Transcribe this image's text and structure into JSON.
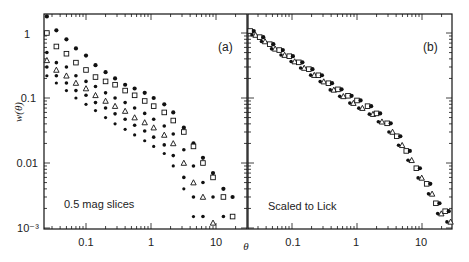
{
  "figure": {
    "panel_a_label": "(a)",
    "panel_b_label": "(b)",
    "panel_a_annotation": "0.5 mag slices",
    "panel_b_annotation": "Scaled to Lick",
    "ylabel": "w(θ)",
    "xlabel": "θ",
    "y_ticks": [
      "1",
      "0.1",
      "0.01",
      "10⁻³"
    ],
    "x_ticks": [
      "0.1",
      "1",
      "10"
    ]
  },
  "chart_data": [
    {
      "type": "scatter",
      "title": "(a)",
      "annotation": "0.5 mag slices",
      "xlabel": "θ",
      "ylabel": "w(θ)",
      "xscale": "log",
      "yscale": "log",
      "xlim": [
        0.022,
        30
      ],
      "ylim": [
        0.001,
        2
      ],
      "x_ticks": [
        0.1,
        1,
        10
      ],
      "y_ticks": [
        1,
        0.1,
        0.01,
        0.001
      ],
      "grid": false,
      "series": [
        {
          "name": "slice 1",
          "marker": "star",
          "x": [
            0.025,
            0.035,
            0.05,
            0.07,
            0.1,
            0.14,
            0.2,
            0.28,
            0.4,
            0.56,
            0.8,
            1.1,
            1.6,
            2.2,
            3.2,
            4.5,
            6.3,
            9,
            13,
            18
          ],
          "y": [
            1.8,
            1.1,
            0.8,
            0.58,
            0.45,
            0.32,
            0.25,
            0.2,
            0.16,
            0.14,
            0.12,
            0.1,
            0.08,
            0.06,
            0.035,
            0.02,
            0.012,
            0.007,
            0.004,
            0.003
          ]
        },
        {
          "name": "slice 2",
          "marker": "open-square",
          "x": [
            0.025,
            0.035,
            0.05,
            0.07,
            0.1,
            0.14,
            0.2,
            0.28,
            0.4,
            0.56,
            0.8,
            1.1,
            1.6,
            2.2,
            3.2,
            4.5,
            6.3,
            9,
            13,
            18
          ],
          "y": [
            1.0,
            0.62,
            0.48,
            0.35,
            0.27,
            0.21,
            0.18,
            0.16,
            0.13,
            0.11,
            0.09,
            0.075,
            0.06,
            0.045,
            0.03,
            0.018,
            0.01,
            0.006,
            0.003,
            0.0015
          ]
        },
        {
          "name": "slice 3",
          "marker": "filled-circle",
          "x": [
            0.025,
            0.035,
            0.05,
            0.07,
            0.1,
            0.14,
            0.2,
            0.28,
            0.4,
            0.56,
            0.8,
            1.1,
            1.6,
            2.2,
            3.2,
            4.5,
            6.3,
            9,
            13
          ],
          "y": [
            0.5,
            0.35,
            0.3,
            0.22,
            0.18,
            0.15,
            0.12,
            0.1,
            0.085,
            0.07,
            0.058,
            0.047,
            0.037,
            0.028,
            0.016,
            0.009,
            0.005,
            0.003,
            0.0015
          ]
        },
        {
          "name": "slice 4",
          "marker": "open-triangle",
          "x": [
            0.025,
            0.035,
            0.05,
            0.07,
            0.1,
            0.14,
            0.2,
            0.28,
            0.4,
            0.56,
            0.8,
            1.1,
            1.6,
            2.2,
            3.2,
            4.5,
            6.3,
            9
          ],
          "y": [
            0.38,
            0.27,
            0.22,
            0.17,
            0.14,
            0.11,
            0.09,
            0.075,
            0.063,
            0.05,
            0.042,
            0.035,
            0.027,
            0.02,
            0.01,
            0.005,
            0.003,
            0.0012
          ]
        },
        {
          "name": "slice 5",
          "marker": "filled-circle",
          "x": [
            0.025,
            0.035,
            0.05,
            0.07,
            0.1,
            0.14,
            0.2,
            0.28,
            0.4,
            0.56,
            0.8,
            1.1,
            1.6,
            2.2,
            3.2,
            4.5,
            6.3
          ],
          "y": [
            0.3,
            0.22,
            0.17,
            0.13,
            0.11,
            0.085,
            0.07,
            0.057,
            0.047,
            0.038,
            0.031,
            0.025,
            0.019,
            0.013,
            0.006,
            0.003,
            0.0015
          ]
        },
        {
          "name": "slice 6",
          "marker": "asterisk",
          "x": [
            0.025,
            0.035,
            0.05,
            0.07,
            0.1,
            0.14,
            0.2,
            0.28,
            0.4,
            0.56,
            0.8,
            1.1,
            1.6,
            2.2,
            3.2,
            4.5
          ],
          "y": [
            0.22,
            0.17,
            0.13,
            0.1,
            0.08,
            0.064,
            0.05,
            0.04,
            0.033,
            0.027,
            0.022,
            0.018,
            0.014,
            0.009,
            0.004,
            0.0015
          ]
        }
      ]
    },
    {
      "type": "scatter",
      "title": "(b)",
      "annotation": "Scaled to Lick",
      "xlabel": "θ",
      "ylabel": "w(θ)",
      "xscale": "log",
      "yscale": "log",
      "xlim": [
        0.022,
        30
      ],
      "ylim": [
        0.001,
        2
      ],
      "x_ticks": [
        0.1,
        1,
        10
      ],
      "y_ticks": [
        1,
        0.1,
        0.01,
        0.001
      ],
      "grid": false,
      "series": [
        {
          "name": "all slices scaled",
          "marker": "mixed",
          "x": [
            0.025,
            0.035,
            0.05,
            0.07,
            0.1,
            0.14,
            0.2,
            0.28,
            0.4,
            0.56,
            0.8,
            1.1,
            1.6,
            2.2,
            3.2,
            4.5,
            6.3,
            9,
            13,
            18,
            25
          ],
          "y": [
            1.0,
            0.8,
            0.62,
            0.5,
            0.4,
            0.32,
            0.25,
            0.2,
            0.15,
            0.12,
            0.095,
            0.08,
            0.065,
            0.05,
            0.035,
            0.022,
            0.013,
            0.007,
            0.004,
            0.002,
            0.0015
          ]
        }
      ]
    }
  ]
}
